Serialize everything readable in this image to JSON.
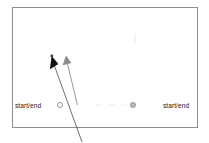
{
  "figure": {
    "title": "",
    "frame": {
      "x": 12,
      "y": 7,
      "width": 186,
      "height": 121,
      "border_color": "#8e8e8e",
      "background": "#ffffff"
    },
    "labels": [
      {
        "id": "left",
        "text": "start/end",
        "x": 15,
        "y": 105
      },
      {
        "id": "right",
        "text": "start/end",
        "x": 163,
        "y": 105
      }
    ],
    "markers": [
      {
        "id": "left-start-end-marker",
        "shape": "circle-open",
        "x": 60,
        "y": 105,
        "radius": 2.6,
        "color": "#8a8a8a",
        "fill": "none"
      },
      {
        "id": "right-start-end-marker",
        "shape": "circle-filled",
        "x": 133,
        "y": 105,
        "radius": 2.6,
        "color": "#9a9a9a",
        "fill": "#b9b9b9"
      }
    ],
    "arrows": [
      {
        "id": "black-arrow",
        "color": "#1a1a1a",
        "head_fill": "#111111",
        "x1": 82,
        "y1": 141,
        "x2": 52.5,
        "y2": 58,
        "head_size": 9
      },
      {
        "id": "gray-arrow",
        "color": "#8c8c8c",
        "head_fill": "#8c8c8c",
        "x1": 77,
        "y1": 105,
        "x2": 66,
        "y2": 57,
        "head_size": 8
      }
    ],
    "faint_marks": [
      {
        "id": "faint-tick",
        "x": 135,
        "y": 38,
        "width": 2,
        "height": 8,
        "color": "#f0f0f0"
      },
      {
        "id": "faint-dash-1",
        "x": 96,
        "y": 105,
        "width": 6,
        "height": 1.4,
        "color": "#efefef"
      },
      {
        "id": "faint-dash-2",
        "x": 110,
        "y": 105,
        "width": 6,
        "height": 1.4,
        "color": "#efefef"
      },
      {
        "id": "faint-dash-3",
        "x": 121,
        "y": 105,
        "width": 5,
        "height": 1.4,
        "color": "#f2f2f2"
      }
    ]
  }
}
